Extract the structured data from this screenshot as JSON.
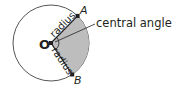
{
  "diagram": {
    "center": {
      "label": "O",
      "x": 51,
      "y": 43
    },
    "circle_radius": 38,
    "points": [
      {
        "label": "A",
        "x": 77,
        "y": 16
      },
      {
        "label": "B",
        "x": 71,
        "y": 73
      }
    ],
    "segments": [
      {
        "from": "O",
        "to": "A",
        "label": "radius"
      },
      {
        "from": "O",
        "to": "B",
        "label": "radius"
      }
    ],
    "callout": {
      "label": "central angle"
    },
    "colors": {
      "stroke": "#231f20",
      "sector_fill": "#bdbdbd",
      "background": "#ffffff"
    }
  }
}
